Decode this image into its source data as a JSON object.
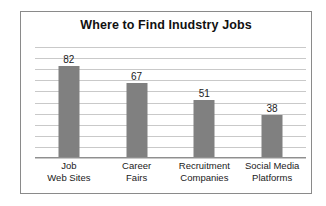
{
  "chart_data": {
    "type": "bar",
    "title": "Where to Find Inudstry Jobs",
    "xlabel": "",
    "ylabel": "",
    "ylim": [
      0,
      100
    ],
    "grid": true,
    "gridline_count": 10,
    "legend": null,
    "categories": [
      "Job Web Sites",
      "Career Fairs",
      "Recruitment Companies",
      "Social Media Platforms"
    ],
    "category_lines": [
      [
        "Job",
        "Web Sites"
      ],
      [
        "Career",
        "Fairs"
      ],
      [
        "Recruitment",
        "Companies"
      ],
      [
        "Social Media",
        "Platforms"
      ]
    ],
    "values": [
      82,
      67,
      51,
      38
    ],
    "value_labels": [
      "82",
      "67",
      "51",
      "38"
    ],
    "colors": {
      "bar_fill": "#808080",
      "gridline": "#c9c9c9",
      "axis": "#8f8f8f",
      "frame_border": "#8a8a8a",
      "background": "#ffffff",
      "text": "#1a1a1a",
      "title_text": "#111111"
    }
  }
}
